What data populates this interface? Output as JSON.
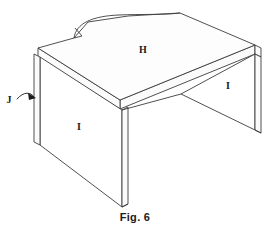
{
  "figure": {
    "caption": "Fig. 6",
    "style": "patent line drawing",
    "line_color": "#3c3c3c",
    "background_color": "#ffffff",
    "text_color": "#1a1a1a"
  },
  "reference_labels": [
    {
      "id": "H",
      "text": "H",
      "refers_to": "desktop-work-surface",
      "x": 143,
      "y": 53
    },
    {
      "id": "I1",
      "text": "I",
      "refers_to": "left-side-panel",
      "x": 79,
      "y": 130
    },
    {
      "id": "I2",
      "text": "I",
      "refers_to": "right-side-panel",
      "x": 228,
      "y": 89
    },
    {
      "id": "J",
      "text": "J",
      "refers_to": "panel-edge-thickness",
      "x": 6,
      "y": 103
    }
  ],
  "leader": {
    "name": "j-leader-arrow",
    "from_label": "J",
    "target": "left-panel-outer-edge",
    "path": "M 18 99 C 25 92, 31 93, 35 97",
    "arrow_points": "36,98 29,94 30,100"
  },
  "geometry": {
    "desktop_top": "M 38 48 L 74 38 L 88 22 L 128 16 L 180 13 L 255 45 L 120 100 Z",
    "desktop_front_edge": "M 120 100 L 120 109 L 255 54 L 255 45 Z",
    "desktop_left_edge": "M 38 48 L 38 57 L 120 109 L 120 100 Z",
    "cutout_curve": "M 74 38 C 76 24, 92 16, 118 15 C 140 14, 164 15, 180 13",
    "cutout_notch": "M 74 38 L 82 36 L 76 29",
    "left_panel_face": "M 40 57 L 122 110 L 122 207 L 40 145 Z",
    "left_panel_thickness": "M 34 54 L 40 57 L 40 145 L 34 142 Z",
    "left_panel_front_thickness": "M 122 110 L 128 107 L 128 204 L 122 207 Z",
    "right_panel_face": "M 181 94 L 255 54 L 255 130 L 181 94 Z",
    "right_panel_thickness": "M 255 54 L 261 57 L 261 133 L 255 130 Z",
    "right_panel_top_line": "M 181 94 L 255 54",
    "apron_line": "M 181 94 L 120 109"
  }
}
